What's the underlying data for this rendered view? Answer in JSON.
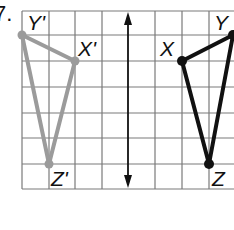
{
  "problem": {
    "number": "7."
  },
  "grid": {
    "x_lines": [
      22,
      49,
      75,
      102,
      128,
      155,
      182,
      209,
      236
    ],
    "y_lines": [
      11,
      35,
      61,
      87,
      113,
      138,
      164,
      189
    ],
    "color": "#7a7a7a"
  },
  "line_of_reflection": {
    "x": 128,
    "y_top": 11,
    "y_bottom": 189,
    "color": "#111111",
    "type": "double-arrow"
  },
  "preimage": {
    "color": "#111111",
    "vertices": [
      {
        "label": "X",
        "x": 182,
        "y": 61
      },
      {
        "label": "Y",
        "x": 233,
        "y": 35
      },
      {
        "label": "Z",
        "x": 209,
        "y": 164
      }
    ]
  },
  "image": {
    "color": "#9b9b9b",
    "vertices": [
      {
        "label": "X'",
        "x": 75,
        "y": 61
      },
      {
        "label": "Y'",
        "x": 22,
        "y": 35
      },
      {
        "label": "Z'",
        "x": 49,
        "y": 164
      }
    ]
  },
  "labels": {
    "X": "X",
    "Y": "Y",
    "Z": "Z",
    "Xp": "X'",
    "Yp": "Y'",
    "Zp": "Z'"
  }
}
